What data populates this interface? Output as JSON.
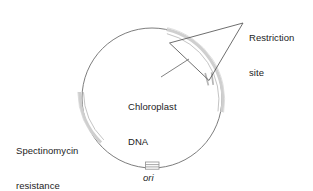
{
  "figure": {
    "type": "plasmid-map-diagram",
    "background_color": "#ffffff"
  },
  "labels": {
    "restriction_site": "Restriction\nsite",
    "restriction_site_line1": "Restriction",
    "restriction_site_line2": "site",
    "chloroplast_dna": "Chloroplast\nDNA",
    "chloroplast_dna_line1": "Chloroplast",
    "chloroplast_dna_line2": "DNA",
    "spectinomycin": "Spectinomycin\nresistance\ngene",
    "spectinomycin_line1": "Spectinomycin",
    "spectinomycin_line2": "resistance",
    "spectinomycin_line3": "gene",
    "ori": "ori"
  },
  "colors": {
    "backbone_stroke": "#6e6e6e",
    "feature_arc": "#c9c9c9",
    "feature_arc_edge": "#b4b4b4",
    "leader_line": "#5a5a5a",
    "ori_marker": "#8a8a8a",
    "text": "#1c1c1c",
    "background": "#ffffff"
  },
  "geometry": {
    "circle_center_x": 152,
    "circle_center_y": 98,
    "circle_radius": 70,
    "backbone_stroke_width": 0.9,
    "feature_arc_stroke_width": 3.2
  },
  "features": [
    {
      "name": "chloroplast-dna-arc",
      "label": "Chloroplast DNA",
      "start_angle_deg": -78,
      "end_angle_deg": 16,
      "style": "thick-light-gray-arc"
    },
    {
      "name": "spectinomycin-resistance-arc",
      "label": "Spectinomycin resistance gene",
      "start_angle_deg": 176,
      "end_angle_deg": 218,
      "style": "thick-light-gray-arc"
    },
    {
      "name": "restriction-site-tick-1",
      "label": "Restriction site",
      "angle_deg": 2,
      "style": "short-tick"
    },
    {
      "name": "restriction-site-tick-2",
      "label": "Restriction site",
      "angle_deg": 11,
      "style": "short-tick"
    },
    {
      "name": "ori-marker",
      "label": "ori",
      "angle_deg": 90,
      "style": "small-rectangle-with-lines"
    }
  ],
  "leader_lines": [
    {
      "name": "restriction-site-leader-upper",
      "from_x": 243,
      "from_y": 23,
      "to_x": 170,
      "to_y": 43
    },
    {
      "name": "restriction-site-leader-lower",
      "from_x": 243,
      "from_y": 23,
      "to_x": 209,
      "to_y": 80
    },
    {
      "name": "restriction-site-leader-base",
      "from_x": 170,
      "from_y": 43,
      "to_x": 209,
      "to_y": 80
    },
    {
      "name": "chloroplast-dna-leader",
      "from_x": 162,
      "from_y": 76,
      "to_x": 188,
      "to_y": 60
    }
  ]
}
